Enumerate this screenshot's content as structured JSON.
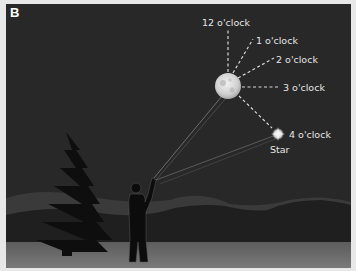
{
  "panel": {
    "letter": "B"
  },
  "labels": {
    "twelve": "12 o'clock",
    "one": "1 o'clock",
    "two": "2 o'clock",
    "three": "3 o'clock",
    "four": "4 o'clock",
    "star": "Star"
  },
  "colors": {
    "sky": "#2a2a2a",
    "ground": "#6a6a6a",
    "mountains": "#1e1e1e",
    "silhouette": "#0c0c0c",
    "text": "#e6e6e6"
  }
}
